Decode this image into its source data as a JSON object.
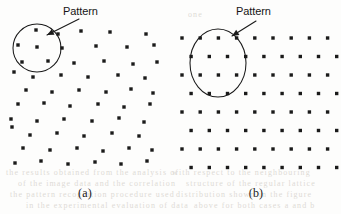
{
  "figure": {
    "background_color": "#fdfdfc",
    "dot_color": "#1a1a1a",
    "stroke_color": "#1a1a1a",
    "width": 341,
    "height": 214
  },
  "panels": [
    {
      "id": "a",
      "caption": "(a)",
      "label": "Pattern",
      "label_color": "#151515",
      "annotation": {
        "shape": "circle",
        "cx": 37,
        "cy": 48,
        "r": 24
      },
      "arrow": {
        "x1": 79,
        "y1": 19,
        "x2": 47,
        "y2": 35
      },
      "dot_layout": "random",
      "dots": [
        [
          36,
          30
        ],
        [
          58,
          34
        ],
        [
          81,
          31
        ],
        [
          110,
          32
        ],
        [
          146,
          34
        ],
        [
          18,
          45
        ],
        [
          37,
          47
        ],
        [
          62,
          48
        ],
        [
          96,
          46
        ],
        [
          127,
          47
        ],
        [
          154,
          45
        ],
        [
          22,
          62
        ],
        [
          48,
          61
        ],
        [
          74,
          63
        ],
        [
          104,
          61
        ],
        [
          133,
          64
        ],
        [
          157,
          62
        ],
        [
          14,
          72
        ],
        [
          33,
          77
        ],
        [
          61,
          75
        ],
        [
          88,
          77
        ],
        [
          118,
          75
        ],
        [
          145,
          78
        ],
        [
          26,
          90
        ],
        [
          52,
          92
        ],
        [
          79,
          90
        ],
        [
          106,
          92
        ],
        [
          131,
          89
        ],
        [
          153,
          93
        ],
        [
          18,
          104
        ],
        [
          44,
          103
        ],
        [
          70,
          106
        ],
        [
          98,
          104
        ],
        [
          124,
          107
        ],
        [
          150,
          104
        ],
        [
          11,
          119
        ],
        [
          37,
          121
        ],
        [
          64,
          119
        ],
        [
          92,
          121
        ],
        [
          119,
          118
        ],
        [
          144,
          122
        ],
        [
          12,
          127
        ],
        [
          30,
          135
        ],
        [
          57,
          133
        ],
        [
          84,
          136
        ],
        [
          112,
          133
        ],
        [
          139,
          136
        ],
        [
          23,
          148
        ],
        [
          50,
          150
        ],
        [
          77,
          148
        ],
        [
          103,
          151
        ],
        [
          129,
          148
        ],
        [
          152,
          150
        ],
        [
          15,
          163
        ],
        [
          41,
          161
        ],
        [
          68,
          164
        ],
        [
          95,
          162
        ],
        [
          121,
          164
        ],
        [
          147,
          161
        ]
      ]
    },
    {
      "id": "b",
      "caption": "(b)",
      "label": "Pattern",
      "label_color": "#151515",
      "annotation": {
        "shape": "ellipse",
        "cx": 47,
        "cy": 63,
        "rx": 28,
        "ry": 34
      },
      "arrow": {
        "x1": 85,
        "y1": 21,
        "x2": 61,
        "y2": 36
      },
      "dot_layout": "lattice",
      "lattice": {
        "origin_x": 11,
        "origin_y": 38,
        "dx": 18.2,
        "dy": 18.5,
        "row_offset": 9.1,
        "cols": 9,
        "rows": 8
      }
    }
  ],
  "scan_artifacts": {
    "color": "#dedbd6",
    "lines": [
      {
        "x": 6,
        "y": 168,
        "text": "the results obtained from the analysis of"
      },
      {
        "x": 18,
        "y": 179,
        "text": "of the image data and the correlation"
      },
      {
        "x": 10,
        "y": 190,
        "text": "the pattern recognition procedure used"
      },
      {
        "x": 26,
        "y": 201,
        "text": "in the experimental evaluation of data"
      },
      {
        "x": 172,
        "y": 168,
        "text": "with respect to the neighbouring"
      },
      {
        "x": 186,
        "y": 179,
        "text": "structure of the regular lattice"
      },
      {
        "x": 176,
        "y": 190,
        "text": "distribution shown in the figure"
      },
      {
        "x": 194,
        "y": 201,
        "text": "above for both cases a and b"
      },
      {
        "x": 188,
        "y": 10,
        "text": "one"
      },
      {
        "x": 14,
        "y": 12,
        "text": ""
      }
    ]
  }
}
